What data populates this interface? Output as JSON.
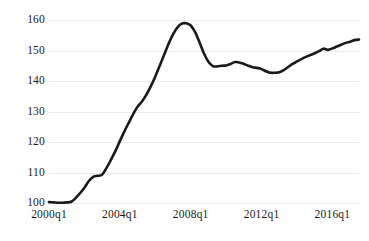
{
  "chart_data": {
    "type": "line",
    "title": "",
    "subtitle": "",
    "xlabel": "",
    "ylabel": "",
    "xlim": [
      "2000q1",
      "2017q3"
    ],
    "ylim": [
      100,
      160
    ],
    "grid": true,
    "legend": false,
    "legend_position": "none",
    "line_color": "#1a1a1a",
    "line_width": 2.6,
    "grid_color": "#ebebeb",
    "background": "#ffffff",
    "y_ticks": [
      100,
      110,
      120,
      130,
      140,
      150,
      160
    ],
    "y_tick_labels": [
      "100",
      "110",
      "120",
      "130",
      "140",
      "150",
      "160"
    ],
    "x_ticks": [
      "2000q1",
      "2004q1",
      "2008q1",
      "2012q1",
      "2016q1"
    ],
    "x_tick_labels": [
      "2000q1",
      "2004q1",
      "2008q1",
      "2012q1",
      "2016q1"
    ],
    "x": [
      "2000q1",
      "2000q2",
      "2000q3",
      "2000q4",
      "2001q1",
      "2001q2",
      "2001q3",
      "2001q4",
      "2002q1",
      "2002q2",
      "2002q3",
      "2002q4",
      "2003q1",
      "2003q2",
      "2003q3",
      "2003q4",
      "2004q1",
      "2004q2",
      "2004q3",
      "2004q4",
      "2005q1",
      "2005q2",
      "2005q3",
      "2005q4",
      "2006q1",
      "2006q2",
      "2006q3",
      "2006q4",
      "2007q1",
      "2007q2",
      "2007q3",
      "2007q4",
      "2008q1",
      "2008q2",
      "2008q3",
      "2008q4",
      "2009q1",
      "2009q2",
      "2009q3",
      "2009q4",
      "2010q1",
      "2010q2",
      "2010q3",
      "2010q4",
      "2011q1",
      "2011q2",
      "2011q3",
      "2011q4",
      "2012q1",
      "2012q2",
      "2012q3",
      "2012q4",
      "2013q1",
      "2013q2",
      "2013q3",
      "2013q4",
      "2014q1",
      "2014q2",
      "2014q3",
      "2014q4",
      "2015q1",
      "2015q2",
      "2015q3",
      "2015q4",
      "2016q1",
      "2016q2",
      "2016q3",
      "2016q4",
      "2017q1",
      "2017q2",
      "2017q3"
    ],
    "values": [
      100.3,
      100.2,
      100.1,
      100.1,
      100.2,
      100.4,
      101.6,
      103.2,
      105.0,
      107.2,
      108.6,
      108.9,
      109.3,
      111.5,
      114.2,
      117.1,
      120.3,
      123.4,
      126.3,
      129.1,
      131.6,
      133.3,
      135.5,
      138.3,
      141.5,
      145.0,
      148.6,
      152.2,
      155.3,
      157.6,
      158.8,
      158.9,
      158.2,
      156.0,
      152.6,
      149.0,
      146.3,
      144.9,
      144.8,
      145.0,
      145.1,
      145.6,
      146.2,
      146.1,
      145.6,
      145.0,
      144.5,
      144.3,
      143.9,
      143.2,
      142.7,
      142.7,
      142.9,
      143.6,
      144.6,
      145.6,
      146.4,
      147.2,
      147.9,
      148.5,
      149.1,
      149.8,
      150.6,
      150.2,
      150.7,
      151.3,
      151.9,
      152.5,
      152.9,
      153.4,
      153.6
    ],
    "series": [
      {
        "name": "index",
        "values": [
          100.3,
          100.2,
          100.1,
          100.1,
          100.2,
          100.4,
          101.6,
          103.2,
          105.0,
          107.2,
          108.6,
          108.9,
          109.3,
          111.5,
          114.2,
          117.1,
          120.3,
          123.4,
          126.3,
          129.1,
          131.6,
          133.3,
          135.5,
          138.3,
          141.5,
          145.0,
          148.6,
          152.2,
          155.3,
          157.6,
          158.8,
          158.9,
          158.2,
          156.0,
          152.6,
          149.0,
          146.3,
          144.9,
          144.8,
          145.0,
          145.1,
          145.6,
          146.2,
          146.1,
          145.6,
          145.0,
          144.5,
          144.3,
          143.9,
          143.2,
          142.7,
          142.7,
          142.9,
          143.6,
          144.6,
          145.6,
          146.4,
          147.2,
          147.9,
          148.5,
          149.1,
          149.8,
          150.6,
          150.2,
          150.7,
          151.3,
          151.9,
          152.5,
          152.9,
          153.4,
          153.6
        ]
      }
    ],
    "annotations": []
  }
}
